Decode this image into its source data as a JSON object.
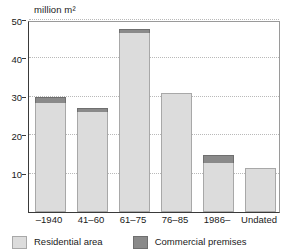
{
  "chart_data": {
    "type": "bar",
    "subtype": "stacked",
    "title": "",
    "unit_label": "million m²",
    "xlabel": "",
    "ylabel": "",
    "categories": [
      "–1940",
      "41–60",
      "61–75",
      "76–85",
      "1986–",
      "Undated"
    ],
    "series": [
      {
        "name": "Residential area",
        "color": "#dcdcdc",
        "values": [
          28.5,
          26.0,
          46.5,
          31.0,
          12.8,
          11.5
        ]
      },
      {
        "name": "Commercial premises",
        "color": "#8a8a8a",
        "values": [
          1.5,
          1.0,
          1.1,
          0.0,
          2.0,
          0.0
        ]
      }
    ],
    "totals": [
      30.0,
      27.0,
      47.6,
      31.0,
      14.8,
      11.5
    ],
    "ylim": [
      0,
      50
    ],
    "yticks": [
      10,
      20,
      30,
      40,
      50
    ],
    "ytick_labels": [
      "10",
      "20",
      "30",
      "40",
      "50"
    ],
    "grid": true,
    "grid_axis": "y",
    "legend_position": "bottom"
  },
  "legend": {
    "items": [
      {
        "label": "Residential area",
        "color": "#dcdcdc"
      },
      {
        "label": "Commercial premises",
        "color": "#8a8a8a"
      }
    ]
  }
}
